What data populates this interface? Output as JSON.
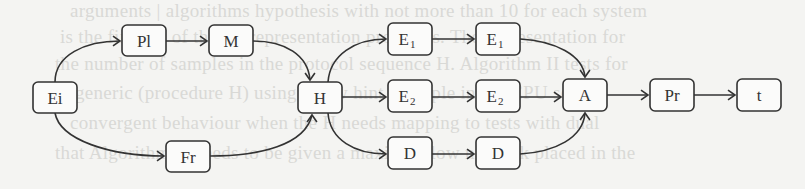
{
  "background_bleed_text": [
    "arguments | algorithms hypothesis with not more than 10 for each system",
    "is the first set of the E1 representation programs. The representation for",
    "the number of samples in the protocol sequence H. Algorithm II tests for",
    "generic (procedure H) using a new hint example in the CPU set",
    "convergent behaviour when the H needs mapping to tests with dual",
    "that Algorithm II needs to be given a maximal flow network placed in the"
  ],
  "diagram": {
    "nodes": [
      {
        "id": "Ei",
        "label": "Ei",
        "sub": "",
        "x": 33,
        "y": 82,
        "w": 44,
        "h": 31
      },
      {
        "id": "Pl",
        "label": "Pl",
        "sub": "",
        "x": 122,
        "y": 25,
        "w": 44,
        "h": 31
      },
      {
        "id": "M",
        "label": "M",
        "sub": "",
        "x": 209,
        "y": 25,
        "w": 44,
        "h": 31
      },
      {
        "id": "Fr",
        "label": "Fr",
        "sub": "",
        "x": 166,
        "y": 141,
        "w": 44,
        "h": 31
      },
      {
        "id": "H",
        "label": "H",
        "sub": "",
        "x": 298,
        "y": 82,
        "w": 44,
        "h": 31
      },
      {
        "id": "E1a",
        "label": "E",
        "sub": "1",
        "x": 388,
        "y": 23,
        "w": 44,
        "h": 32
      },
      {
        "id": "E1b",
        "label": "E",
        "sub": "1",
        "x": 476,
        "y": 23,
        "w": 44,
        "h": 32
      },
      {
        "id": "E2a",
        "label": "E",
        "sub": "2",
        "x": 388,
        "y": 80,
        "w": 44,
        "h": 32
      },
      {
        "id": "E2b",
        "label": "E",
        "sub": "2",
        "x": 476,
        "y": 80,
        "w": 44,
        "h": 32
      },
      {
        "id": "Da",
        "label": "D",
        "sub": "",
        "x": 388,
        "y": 137,
        "w": 44,
        "h": 32
      },
      {
        "id": "Db",
        "label": "D",
        "sub": "",
        "x": 476,
        "y": 137,
        "w": 44,
        "h": 32
      },
      {
        "id": "A",
        "label": "A",
        "sub": "",
        "x": 563,
        "y": 79,
        "w": 44,
        "h": 32
      },
      {
        "id": "Pr",
        "label": "Pr",
        "sub": "",
        "x": 650,
        "y": 79,
        "w": 44,
        "h": 32
      },
      {
        "id": "t",
        "label": "t",
        "sub": "",
        "x": 737,
        "y": 79,
        "w": 44,
        "h": 32
      }
    ],
    "edges": [
      {
        "from": "Ei",
        "to": "Pl",
        "path": "M 55 82 C 55 55, 85 41, 120 41",
        "head": [
          120,
          41,
          "right"
        ]
      },
      {
        "from": "Pl",
        "to": "M",
        "path": "M 166 41 L 207 41",
        "head": [
          207,
          41,
          "right"
        ]
      },
      {
        "from": "M",
        "to": "H",
        "path": "M 253 41 C 285 41, 308 55, 310 80",
        "head": [
          310,
          80,
          "down"
        ]
      },
      {
        "from": "Ei",
        "to": "Fr",
        "path": "M 55 113 C 60 140, 110 156, 164 156",
        "head": [
          164,
          156,
          "right"
        ]
      },
      {
        "from": "Fr",
        "to": "H",
        "path": "M 210 156 C 260 156, 305 145, 312 115",
        "head": [
          312,
          115,
          "up"
        ]
      },
      {
        "from": "H",
        "to": "E1a",
        "path": "M 328 82 C 330 55, 355 39, 386 39",
        "head": [
          386,
          39,
          "right"
        ]
      },
      {
        "from": "H",
        "to": "E2a",
        "path": "M 342 97 L 386 97",
        "head": [
          386,
          97,
          "right"
        ]
      },
      {
        "from": "H",
        "to": "Da",
        "path": "M 328 113 C 330 140, 355 154, 386 154",
        "head": [
          386,
          154,
          "right"
        ]
      },
      {
        "from": "E1a",
        "to": "E1b",
        "path": "M 432 39 L 474 39",
        "head": [
          474,
          39,
          "right"
        ]
      },
      {
        "from": "E2a",
        "to": "E2b",
        "path": "M 432 97 L 474 97",
        "head": [
          474,
          97,
          "right"
        ]
      },
      {
        "from": "Da",
        "to": "Db",
        "path": "M 432 154 L 474 154",
        "head": [
          474,
          154,
          "right"
        ]
      },
      {
        "from": "E1b",
        "to": "A",
        "path": "M 520 39 C 555 41, 583 55, 585 77",
        "head": [
          585,
          77,
          "down"
        ]
      },
      {
        "from": "E2b",
        "to": "A",
        "path": "M 520 97 L 561 97",
        "head": [
          561,
          97,
          "right"
        ]
      },
      {
        "from": "Db",
        "to": "A",
        "path": "M 520 154 C 555 152, 583 138, 585 113",
        "head": [
          585,
          113,
          "up"
        ]
      },
      {
        "from": "A",
        "to": "Pr",
        "path": "M 607 95 L 648 95",
        "head": [
          648,
          95,
          "right"
        ]
      },
      {
        "from": "Pr",
        "to": "t",
        "path": "M 694 95 L 735 95",
        "head": [
          735,
          95,
          "right"
        ]
      }
    ]
  }
}
